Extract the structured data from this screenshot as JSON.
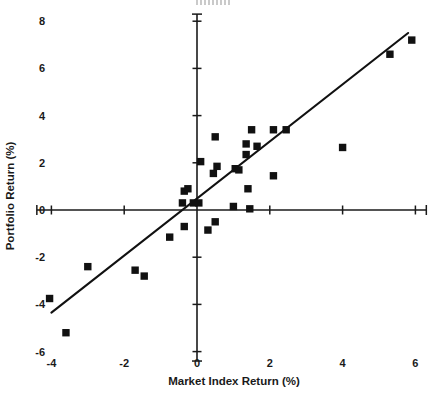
{
  "chart_data": {
    "type": "scatter",
    "title": "",
    "xlabel": "Market Index Return (%)",
    "ylabel": "Portfolio Return (%)",
    "xlim": [
      -4.4,
      6.3
    ],
    "ylim": [
      -6.4,
      8.3
    ],
    "xticks": [
      -4,
      -2,
      0,
      2,
      4,
      6
    ],
    "xtick_labels": [
      "-4",
      "-2",
      "0",
      "2",
      "4",
      "6"
    ],
    "yticks": [
      -6,
      -4,
      -2,
      0,
      2,
      4,
      6,
      8
    ],
    "ytick_labels": [
      "-6",
      "-4",
      "-2",
      "0",
      "2",
      "4",
      "6",
      "8"
    ],
    "grid": false,
    "legend": null,
    "marker": "square",
    "marker_color": "#111111",
    "axes_style": "crossed-at-origin",
    "points": [
      {
        "x": -4.05,
        "y": -3.75
      },
      {
        "x": -3.6,
        "y": -5.2
      },
      {
        "x": -3.0,
        "y": -2.4
      },
      {
        "x": -1.7,
        "y": -2.55
      },
      {
        "x": -1.45,
        "y": -2.8
      },
      {
        "x": -0.75,
        "y": -1.15
      },
      {
        "x": -0.35,
        "y": -0.7
      },
      {
        "x": -0.4,
        "y": 0.3
      },
      {
        "x": -0.35,
        "y": 0.8
      },
      {
        "x": -0.25,
        "y": 0.9
      },
      {
        "x": -0.1,
        "y": 0.3
      },
      {
        "x": 0.05,
        "y": 0.3
      },
      {
        "x": 0.1,
        "y": 2.05
      },
      {
        "x": 0.3,
        "y": -0.85
      },
      {
        "x": 0.5,
        "y": -0.5
      },
      {
        "x": 0.45,
        "y": 1.55
      },
      {
        "x": 0.5,
        "y": 3.1
      },
      {
        "x": 0.55,
        "y": 1.85
      },
      {
        "x": 1.0,
        "y": 0.15
      },
      {
        "x": 1.05,
        "y": 1.75
      },
      {
        "x": 1.15,
        "y": 1.7
      },
      {
        "x": 1.35,
        "y": 2.35
      },
      {
        "x": 1.35,
        "y": 2.8
      },
      {
        "x": 1.4,
        "y": 0.9
      },
      {
        "x": 1.45,
        "y": 0.05
      },
      {
        "x": 1.5,
        "y": 3.4
      },
      {
        "x": 1.65,
        "y": 2.7
      },
      {
        "x": 2.1,
        "y": 1.45
      },
      {
        "x": 2.1,
        "y": 3.4
      },
      {
        "x": 2.45,
        "y": 3.4
      },
      {
        "x": 4.0,
        "y": 2.65
      },
      {
        "x": 5.3,
        "y": 6.6
      },
      {
        "x": 5.9,
        "y": 7.2
      }
    ],
    "fit_line": {
      "x_start": -4.0,
      "y_start": -4.35,
      "x_end": 5.8,
      "y_end": 7.5,
      "color": "#111111"
    }
  }
}
